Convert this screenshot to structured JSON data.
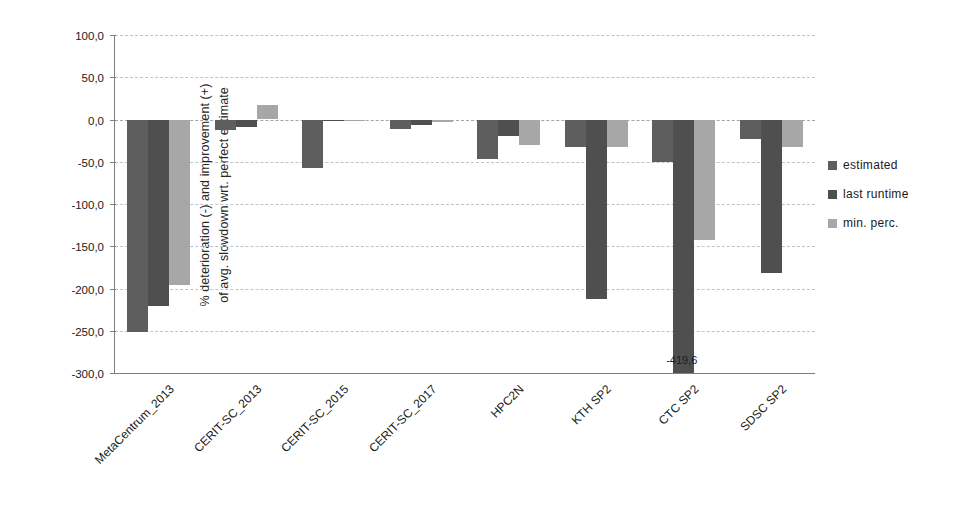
{
  "chart_data": {
    "type": "bar",
    "title": "",
    "xlabel": "",
    "ylabel_line1": "% deterioration (-) and improvement (+)",
    "ylabel_line2": "of  avg. slowdown wrt. perfect estimate",
    "ylim": [
      -300.0,
      100.0
    ],
    "ytick_labels": [
      "100,0",
      "50,0",
      "0,0",
      "-50,0",
      "-100,0",
      "-150,0",
      "-200,0",
      "-250,0",
      "-300,0"
    ],
    "ytick_values": [
      100.0,
      50.0,
      0.0,
      -50.0,
      -100.0,
      -150.0,
      -200.0,
      -250.0,
      -300.0
    ],
    "grid": true,
    "legend_position": "right",
    "categories": [
      "MetaCentrum_2013",
      "CERIT-SC_2013",
      "CERIT-SC_2015",
      "CERIT-SC_2017",
      "HPC2N",
      "KTH SP2",
      "CTC SP2",
      "SDSC SP2"
    ],
    "series": [
      {
        "name": "estimated",
        "color": "#5e5e5e",
        "values": [
          -252.0,
          -12.0,
          -57.0,
          -11.0,
          -47.0,
          -33.0,
          -50.0,
          -23.0
        ]
      },
      {
        "name": "last runtime",
        "color": "#4f4f4f",
        "values": [
          -221.0,
          -9.0,
          -1.5,
          -7.0,
          -19.0,
          -213.0,
          -419.6,
          -182.0
        ]
      },
      {
        "name": "min. perc.",
        "color": "#a7a7a7",
        "values": [
          -196.0,
          17.0,
          -2.0,
          -3.0,
          -30.0,
          -33.0,
          -143.0,
          -33.0
        ]
      }
    ],
    "annotations": [
      {
        "text": "-419,6",
        "category": "CTC SP2",
        "series": "last runtime",
        "note": "value extends below the plotted axis minimum"
      }
    ]
  },
  "legend": {
    "items": [
      {
        "label": "estimated",
        "color": "#5e5e5e"
      },
      {
        "label": "last runtime",
        "color": "#4f4f4f"
      },
      {
        "label": "min. perc.",
        "color": "#a7a7a7"
      }
    ]
  }
}
